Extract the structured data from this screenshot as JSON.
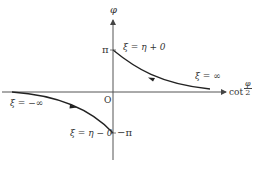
{
  "diagram": {
    "type": "phase-curve-plot",
    "axes": {
      "y_axis_label": "φ",
      "x_axis_label_prefix": "cot",
      "x_axis_label_fraction": {
        "numerator": "φ",
        "denominator": "2"
      },
      "origin_label": "O"
    },
    "ticks": {
      "pi": "π",
      "minus_pi": "−π"
    },
    "curves": [
      {
        "name": "upper-branch",
        "start_label": "ξ = η + 0",
        "end_label": "ξ = ∞",
        "direction": "toward φ axis (leftward)"
      },
      {
        "name": "lower-branch",
        "start_label": "ξ = −∞",
        "end_label": "ξ = η − 0",
        "direction": "toward −π (rightward)"
      }
    ],
    "colors": {
      "axis": "#555555",
      "curve": "#222222",
      "text": "#333333"
    }
  },
  "labels": {
    "phi_axis": "φ",
    "pi": "π",
    "minus_pi": "−π",
    "origin": "O",
    "xi_eta_plus": "ξ = η + 0",
    "xi_inf": "ξ = ∞",
    "xi_minus_inf": "ξ = −∞",
    "xi_eta_minus": "ξ = η − 0",
    "cot": "cot",
    "frac_num": "φ",
    "frac_den": "2"
  }
}
